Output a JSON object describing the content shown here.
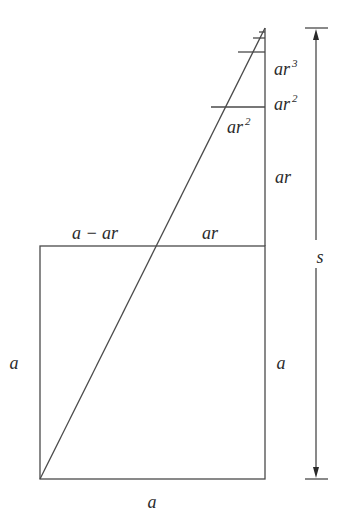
{
  "diagram": {
    "labels": {
      "square_bottom": "a",
      "square_left": "a",
      "square_right": "a",
      "top_left_segment": "a − ar",
      "top_right_segment": "ar",
      "right_ar": "ar",
      "triangle_ar2": "ar",
      "triangle_ar2_exp": "2",
      "right_ar2": "ar",
      "right_ar2_exp": "2",
      "right_ar3": "ar",
      "right_ar3_exp": "3",
      "total": "s"
    },
    "colors": {
      "stroke": "#4a4a4a",
      "text": "#2a2a2a",
      "background": "#ffffff"
    }
  }
}
